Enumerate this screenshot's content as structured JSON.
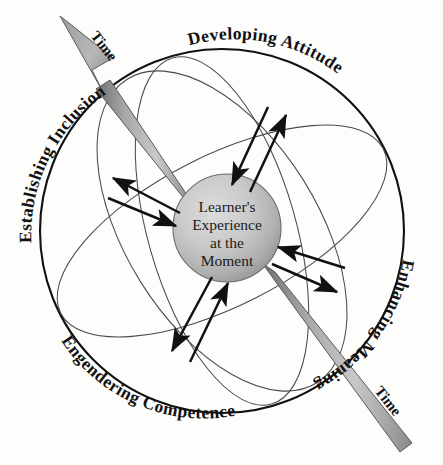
{
  "diagram": {
    "background_color": "#fdfdfb",
    "outer_circle": {
      "stroke_color": "#111111",
      "fill": "none"
    },
    "center_sphere": {
      "name": "learners-experience-sphere",
      "fill_light": "#d5d5d5",
      "fill_dark": "#9a9a9a",
      "stroke_color": "#555555",
      "lines": [
        "Learner's",
        "Experience",
        "at the",
        "Moment"
      ]
    },
    "quadrant_labels": [
      {
        "id": "developing-attitude",
        "text": "Developing Attitude",
        "position": "top-right-arc"
      },
      {
        "id": "enhancing-meaning",
        "text": "Enhancing Meaning",
        "position": "right-arc"
      },
      {
        "id": "engendering-competence",
        "text": "Engendering Competence",
        "position": "bottom-left-arc"
      },
      {
        "id": "establishing-inclusion",
        "text": "Establishing Inclusion",
        "position": "left-arc"
      }
    ],
    "time_axis": {
      "color_light": "#b4b4b4",
      "color_dark": "#7c7c7c",
      "stroke_color": "#555555",
      "head_label": "Time",
      "tail_label": "Time",
      "direction": "bottom-right to top-left"
    },
    "orbit_ellipses": {
      "count": 3,
      "stroke_color": "#4a4a4a"
    },
    "arrow_pairs": {
      "count": 4,
      "stroke_color": "#111111",
      "description": "bidirectional arrow pairs entering and leaving the sphere"
    }
  }
}
